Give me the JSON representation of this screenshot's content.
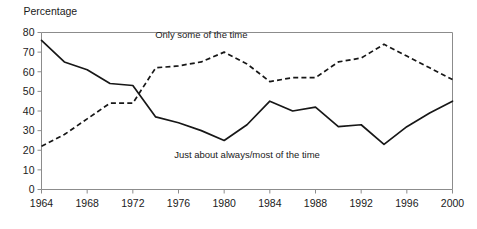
{
  "chart_data": {
    "type": "line",
    "title": "",
    "xlabel": "",
    "ylabel": "Percentage",
    "ylim": [
      0,
      80
    ],
    "xlim": [
      1964,
      2000
    ],
    "grid": false,
    "legend_position": "inline-annotations",
    "y_ticks": [
      "0",
      "10",
      "20",
      "30",
      "40",
      "50",
      "60",
      "70",
      "80"
    ],
    "x_ticks": [
      "1964",
      "1968",
      "1972",
      "1976",
      "1980",
      "1984",
      "1988",
      "1992",
      "1996",
      "2000"
    ],
    "x": [
      1964,
      1966,
      1968,
      1970,
      1972,
      1974,
      1976,
      1978,
      1980,
      1982,
      1984,
      1986,
      1988,
      1990,
      1992,
      1994,
      1996,
      1998,
      2000
    ],
    "series": [
      {
        "name": "Just about always/most of the time",
        "style": "solid",
        "values": [
          76,
          65,
          61,
          54,
          53,
          37,
          34,
          30,
          25,
          33,
          45,
          40,
          42,
          32,
          33,
          23,
          32,
          39,
          45
        ]
      },
      {
        "name": "Only some of the time",
        "style": "dashed",
        "values": [
          22,
          28,
          36,
          44,
          44,
          62,
          63,
          65,
          70,
          64,
          55,
          57,
          57,
          65,
          67,
          74,
          68,
          62,
          56
        ]
      }
    ],
    "annotations": [
      {
        "text": "Only some of the time",
        "x": 1978,
        "y": 77
      },
      {
        "text": "Just about always/most of the time",
        "x": 1982,
        "y": 16
      }
    ],
    "colors": {
      "line": "#171717",
      "axis": "#8c8c8c",
      "background": "#ffffff"
    }
  }
}
